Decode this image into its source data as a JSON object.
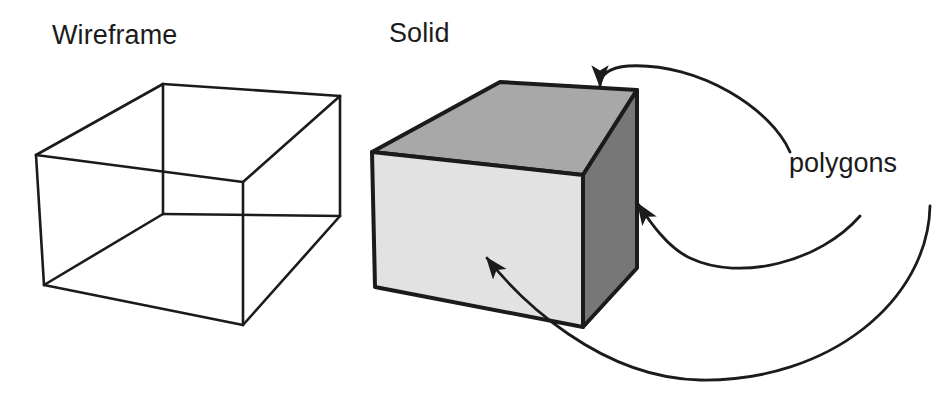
{
  "figure": {
    "title_left": "Wireframe",
    "title_right": "Solid",
    "callout_label": "polygons",
    "background": "#ffffff",
    "ink": "#1b1b1b"
  },
  "labels": {
    "wireframe": "Wireframe",
    "solid": "Solid",
    "polygons": "polygons"
  },
  "colors": {
    "outline": "#1b1b1b",
    "front_face": "#e2e2e2",
    "top_face": "#a8a8a8",
    "right_face": "#777777",
    "wire_stroke": "#1b1b1b",
    "arrow": "#1b1b1b",
    "paper": "#ffffff"
  },
  "wireframe_box": {
    "description": "open-edge box drawn with visible hidden lines",
    "vertices": {
      "front_top_left": [
        36,
        155
      ],
      "front_top_right": [
        243,
        182
      ],
      "back_top_left": [
        163,
        84
      ],
      "back_top_right": [
        340,
        96
      ],
      "front_bottom_left": [
        44,
        285
      ],
      "front_bottom_right": [
        243,
        325
      ],
      "back_bottom_left": [
        163,
        214
      ],
      "back_bottom_right": [
        340,
        216
      ]
    },
    "stroke_width": 2.6
  },
  "solid_box": {
    "description": "shaded block with three visible polygon faces",
    "vertices": {
      "front_top_left": [
        372,
        152
      ],
      "front_top_right": [
        583,
        175
      ],
      "front_bottom_left": [
        375,
        287
      ],
      "front_bottom_right": [
        583,
        327
      ],
      "top_back_left": [
        500,
        82
      ],
      "top_back_right": [
        637,
        90
      ],
      "right_back_bottom": [
        637,
        268
      ]
    },
    "faces": [
      {
        "name": "front-face",
        "fill": "#e2e2e2"
      },
      {
        "name": "top-face",
        "fill": "#a8a8a8"
      },
      {
        "name": "right-face",
        "fill": "#777777"
      }
    ],
    "stroke_width": 4
  },
  "callouts": [
    {
      "name": "callout-top-face",
      "target_face": "top-face",
      "arrow_tip": [
        600,
        92
      ],
      "path": "M 790 152 C 772 110, 700 62, 628 66 C 604 68, 600 78, 600 86"
    },
    {
      "name": "callout-right-face",
      "target_face": "right-face",
      "arrow_tip": [
        632,
        196
      ],
      "path": "M 860 216 C 820 262, 740 282, 690 258 C 668 248, 650 222, 638 204"
    },
    {
      "name": "callout-front-face",
      "target_face": "front-face",
      "arrow_tip": [
        480,
        250
      ],
      "path": "M 930 206 C 928 300, 830 382, 700 380 C 600 378, 520 300, 487 258"
    }
  ]
}
